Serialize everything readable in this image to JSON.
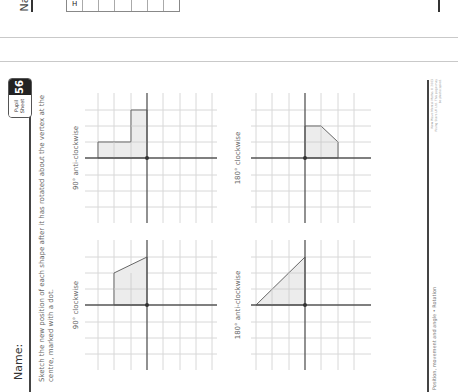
{
  "previous_page": {
    "name_partial": "Na",
    "table_header": "H",
    "table_cells": [
      "",
      "",
      "",
      "",
      "",
      ""
    ],
    "right_label_partial": "Data"
  },
  "header": {
    "name_label": "Name:",
    "badge": {
      "label": "Pupil Sheet",
      "number": "56"
    }
  },
  "instructions": "Sketch the new position of each shape after it has rotated about the vertex at the centre, marked with a dot.",
  "panels": [
    {
      "title": "90° clockwise",
      "shape": "trapezium",
      "vertices": [
        [
          0,
          0
        ],
        [
          0,
          2
        ],
        [
          2,
          2
        ],
        [
          3,
          0
        ]
      ]
    },
    {
      "title": "90° anti-clockwise",
      "shape": "L-shape",
      "vertices": [
        [
          0,
          0
        ],
        [
          0,
          3
        ],
        [
          1,
          3
        ],
        [
          1,
          1
        ],
        [
          3,
          1
        ],
        [
          3,
          0
        ]
      ]
    },
    {
      "title": "180° anti-clockwise",
      "shape": "right-triangle",
      "vertices": [
        [
          0,
          0
        ],
        [
          0,
          3
        ],
        [
          3,
          0
        ]
      ]
    },
    {
      "title": "180° clockwise",
      "shape": "pentagon",
      "vertices": [
        [
          0,
          0
        ],
        [
          2,
          0
        ],
        [
          2,
          -1
        ],
        [
          1,
          -2
        ],
        [
          0,
          -2
        ]
      ]
    }
  ],
  "footer": {
    "topic": "Position, movement and angle • Rotation",
    "copyright": "New Wave Mental Maths © 2003 Rising Stars UK Ltd. This page may be photocopied."
  },
  "colors": {
    "shape_fill": "#ececec",
    "axis": "#555555",
    "grid": "#d8d8d8",
    "badge_bg": "#222222"
  }
}
